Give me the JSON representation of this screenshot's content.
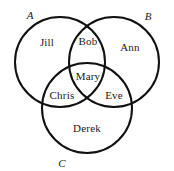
{
  "figure": {
    "type": "venn-diagram",
    "background_color": "#ffffff",
    "stroke_color": "#111111",
    "text_color": "#1a1a1a"
  },
  "sets": [
    {
      "id": "A",
      "label": "A",
      "label_x": 30,
      "label_y": 15,
      "cx": 60,
      "cy": 62,
      "r": 45
    },
    {
      "id": "B",
      "label": "B",
      "label_x": 148,
      "label_y": 16,
      "cx": 114,
      "cy": 62,
      "r": 45
    },
    {
      "id": "C",
      "label": "C",
      "label_x": 62,
      "label_y": 163,
      "cx": 87,
      "cy": 108,
      "r": 45
    }
  ],
  "regions": [
    {
      "id": "A-only",
      "name": "Jill",
      "x": 47,
      "y": 42
    },
    {
      "id": "B-only",
      "name": "Ann",
      "x": 130,
      "y": 47
    },
    {
      "id": "C-only",
      "name": "Derek",
      "x": 87,
      "y": 128
    },
    {
      "id": "A-and-B",
      "name": "Bob",
      "x": 88,
      "y": 41
    },
    {
      "id": "A-and-C",
      "name": "Chris",
      "x": 62,
      "y": 95
    },
    {
      "id": "B-and-C",
      "name": "Eve",
      "x": 114,
      "y": 95
    },
    {
      "id": "A-B-and-C",
      "name": "Mary",
      "x": 88,
      "y": 76
    }
  ]
}
